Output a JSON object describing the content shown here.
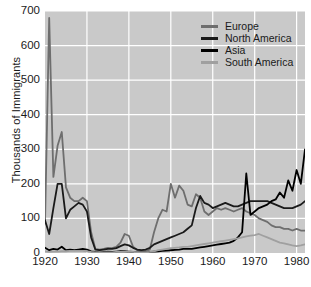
{
  "chart_data": {
    "type": "line",
    "title": "",
    "xlabel": "",
    "ylabel": "Thousands of Immigrants",
    "xlim": [
      1920,
      1982
    ],
    "ylim": [
      0,
      700
    ],
    "grid": true,
    "legend_position": "top-right",
    "background_color": "#c9c9c9",
    "gridline_color": "#ffffff",
    "xticks": [
      1920,
      1930,
      1940,
      1950,
      1960,
      1970,
      1980
    ],
    "yticks": [
      0,
      100,
      200,
      300,
      400,
      500,
      600,
      700
    ],
    "series": [
      {
        "name": "Europe",
        "color": "#6e6e6e",
        "x": [
          1920,
          1921,
          1922,
          1923,
          1924,
          1925,
          1926,
          1927,
          1928,
          1929,
          1930,
          1931,
          1932,
          1933,
          1934,
          1935,
          1936,
          1937,
          1938,
          1939,
          1940,
          1941,
          1942,
          1943,
          1944,
          1945,
          1946,
          1947,
          1948,
          1949,
          1950,
          1951,
          1952,
          1953,
          1954,
          1955,
          1956,
          1957,
          1958,
          1959,
          1960,
          1961,
          1962,
          1963,
          1964,
          1965,
          1966,
          1967,
          1968,
          1969,
          1970,
          1971,
          1972,
          1973,
          1974,
          1975,
          1976,
          1977,
          1978,
          1979,
          1980,
          1981,
          1982
        ],
        "values": [
          85,
          680,
          220,
          310,
          350,
          190,
          160,
          150,
          150,
          160,
          150,
          60,
          12,
          10,
          12,
          15,
          14,
          18,
          30,
          55,
          50,
          18,
          8,
          5,
          6,
          10,
          60,
          100,
          125,
          120,
          200,
          160,
          195,
          180,
          140,
          135,
          170,
          160,
          120,
          110,
          120,
          130,
          125,
          130,
          125,
          120,
          125,
          130,
          120,
          115,
          110,
          100,
          95,
          90,
          80,
          75,
          75,
          70,
          70,
          65,
          70,
          65,
          65
        ]
      },
      {
        "name": "North America",
        "color": "#1a1a1a",
        "x": [
          1920,
          1921,
          1922,
          1923,
          1924,
          1925,
          1926,
          1927,
          1928,
          1929,
          1930,
          1931,
          1932,
          1933,
          1934,
          1935,
          1936,
          1937,
          1938,
          1939,
          1940,
          1941,
          1942,
          1943,
          1944,
          1945,
          1946,
          1947,
          1948,
          1949,
          1950,
          1951,
          1952,
          1953,
          1954,
          1955,
          1956,
          1957,
          1958,
          1959,
          1960,
          1961,
          1962,
          1963,
          1964,
          1965,
          1966,
          1967,
          1968,
          1969,
          1970,
          1971,
          1972,
          1973,
          1974,
          1975,
          1976,
          1977,
          1978,
          1979,
          1980,
          1981,
          1982
        ],
        "values": [
          95,
          55,
          130,
          200,
          200,
          100,
          125,
          135,
          145,
          140,
          120,
          45,
          10,
          8,
          10,
          12,
          12,
          14,
          20,
          25,
          22,
          15,
          10,
          8,
          10,
          15,
          25,
          30,
          35,
          40,
          45,
          50,
          55,
          60,
          70,
          80,
          130,
          165,
          145,
          140,
          130,
          135,
          140,
          145,
          140,
          135,
          135,
          140,
          145,
          150,
          150,
          150,
          150,
          150,
          145,
          140,
          135,
          130,
          130,
          130,
          135,
          140,
          150
        ]
      },
      {
        "name": "Asia",
        "color": "#000000",
        "x": [
          1920,
          1921,
          1922,
          1923,
          1924,
          1925,
          1926,
          1927,
          1928,
          1929,
          1930,
          1931,
          1932,
          1933,
          1934,
          1935,
          1936,
          1937,
          1938,
          1939,
          1940,
          1941,
          1942,
          1943,
          1944,
          1945,
          1946,
          1947,
          1948,
          1949,
          1950,
          1951,
          1952,
          1953,
          1954,
          1955,
          1956,
          1957,
          1958,
          1959,
          1960,
          1961,
          1962,
          1963,
          1964,
          1965,
          1966,
          1967,
          1968,
          1969,
          1970,
          1971,
          1972,
          1973,
          1974,
          1975,
          1976,
          1977,
          1978,
          1979,
          1980,
          1981,
          1982
        ],
        "values": [
          15,
          8,
          12,
          10,
          18,
          8,
          10,
          8,
          10,
          12,
          10,
          5,
          3,
          2,
          3,
          4,
          3,
          4,
          5,
          5,
          4,
          3,
          2,
          2,
          2,
          3,
          4,
          5,
          6,
          7,
          8,
          9,
          10,
          12,
          12,
          12,
          14,
          16,
          18,
          20,
          22,
          24,
          26,
          28,
          30,
          35,
          45,
          60,
          230,
          110,
          120,
          130,
          135,
          140,
          150,
          155,
          175,
          160,
          210,
          180,
          240,
          200,
          300
        ]
      },
      {
        "name": "South America",
        "color": "#a0a0a0",
        "x": [
          1920,
          1921,
          1922,
          1923,
          1924,
          1925,
          1926,
          1927,
          1928,
          1929,
          1930,
          1931,
          1932,
          1933,
          1934,
          1935,
          1936,
          1937,
          1938,
          1939,
          1940,
          1941,
          1942,
          1943,
          1944,
          1945,
          1946,
          1947,
          1948,
          1949,
          1950,
          1951,
          1952,
          1953,
          1954,
          1955,
          1956,
          1957,
          1958,
          1959,
          1960,
          1961,
          1962,
          1963,
          1964,
          1965,
          1966,
          1967,
          1968,
          1969,
          1970,
          1971,
          1972,
          1973,
          1974,
          1975,
          1976,
          1977,
          1978,
          1979,
          1980,
          1981,
          1982
        ],
        "values": [
          5,
          3,
          4,
          4,
          5,
          5,
          6,
          6,
          6,
          6,
          5,
          3,
          2,
          2,
          2,
          2,
          2,
          3,
          3,
          4,
          4,
          3,
          2,
          2,
          2,
          3,
          5,
          8,
          10,
          12,
          14,
          15,
          16,
          18,
          18,
          20,
          22,
          24,
          26,
          28,
          30,
          32,
          34,
          36,
          38,
          40,
          42,
          45,
          48,
          50,
          52,
          55,
          50,
          45,
          40,
          35,
          30,
          28,
          25,
          22,
          20,
          22,
          25
        ]
      }
    ]
  },
  "legend": {
    "items": [
      {
        "label": "Europe"
      },
      {
        "label": "North America"
      },
      {
        "label": "Asia"
      },
      {
        "label": "South America"
      }
    ]
  }
}
